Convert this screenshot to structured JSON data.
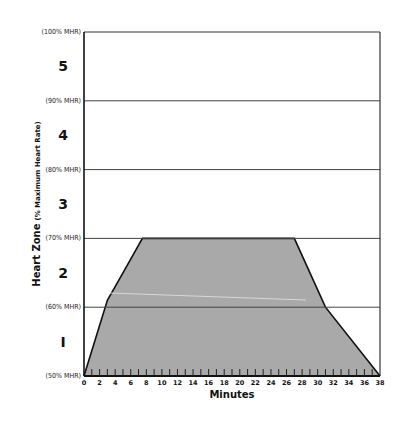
{
  "chart_data": {
    "type": "area",
    "title": "",
    "xlabel": "Minutes",
    "ylabel": "Heart Zone",
    "ylabel_sub": "(% Maximum Heart Rate)",
    "xlim": [
      0,
      38
    ],
    "ylim": [
      50,
      100
    ],
    "x_ticks": [
      0,
      2,
      4,
      6,
      8,
      10,
      12,
      14,
      16,
      18,
      20,
      22,
      24,
      26,
      28,
      30,
      32,
      34,
      36,
      38
    ],
    "y_gridlines": [
      {
        "value": 100,
        "label": "(100% MHR)"
      },
      {
        "value": 90,
        "label": "(90% MHR)"
      },
      {
        "value": 80,
        "label": "(80% MHR)"
      },
      {
        "value": 70,
        "label": "(70% MHR)"
      },
      {
        "value": 60,
        "label": "(60% MHR)"
      },
      {
        "value": 50,
        "label": "(50% MHR)"
      }
    ],
    "zones": [
      {
        "label": "5",
        "from": 90,
        "to": 100
      },
      {
        "label": "4",
        "from": 80,
        "to": 90
      },
      {
        "label": "3",
        "from": 70,
        "to": 80
      },
      {
        "label": "2",
        "from": 60,
        "to": 70
      },
      {
        "label": "I",
        "from": 50,
        "to": 60
      }
    ],
    "series": [
      {
        "name": "Workout intensity",
        "x": [
          0,
          3,
          5,
          7.5,
          27,
          31,
          38
        ],
        "values": [
          50,
          61,
          65,
          70,
          70,
          60,
          50
        ],
        "fill": "#a9a9a9",
        "stroke": "#111111"
      }
    ],
    "grid": true,
    "legend": null
  }
}
